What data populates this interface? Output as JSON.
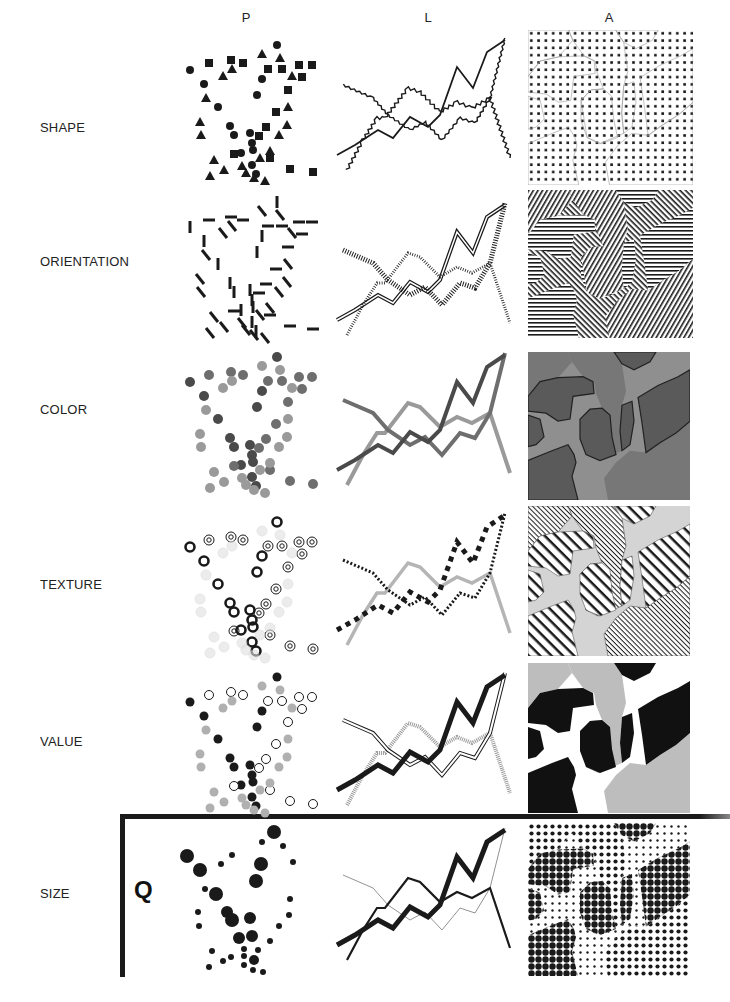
{
  "figure": {
    "columns": [
      {
        "key": "P",
        "label": "P",
        "meaning": "point"
      },
      {
        "key": "L",
        "label": "L",
        "meaning": "line"
      },
      {
        "key": "A",
        "label": "A",
        "meaning": "area"
      }
    ],
    "rows": [
      {
        "key": "shape",
        "label": "SHAPE"
      },
      {
        "key": "orientation",
        "label": "ORIENTATION"
      },
      {
        "key": "color",
        "label": "COLOR"
      },
      {
        "key": "texture",
        "label": "TEXTURE"
      },
      {
        "key": "value",
        "label": "VALUE"
      },
      {
        "key": "size",
        "label": "SIZE"
      }
    ],
    "quantitative_marker": "Q",
    "colors": {
      "ink": "#1a1a1a",
      "dark_gray": "#4a4a4a",
      "mid_gray": "#6e6e6e",
      "light_gray": "#9a9a9a",
      "pale_gray": "#c8c8c8",
      "area_dark": "#5a5a5a",
      "area_mid": "#777777",
      "area_light": "#8f8f8f"
    }
  },
  "chart_data": {
    "type": "scatter",
    "rows": [
      "SHAPE",
      "ORIENTATION",
      "COLOR",
      "TEXTURE",
      "VALUE",
      "SIZE"
    ],
    "columns": [
      "P",
      "L",
      "A"
    ],
    "points": [
      [
        97,
        17,
        0
      ],
      [
        10,
        42,
        0
      ],
      [
        24,
        56,
        0
      ],
      [
        82,
        51,
        0
      ],
      [
        77,
        67,
        0
      ],
      [
        38,
        79,
        0
      ],
      [
        50,
        98,
        0
      ],
      [
        54,
        107,
        0
      ],
      [
        70,
        105,
        0
      ],
      [
        72,
        115,
        0
      ],
      [
        73,
        122,
        0
      ],
      [
        61,
        125,
        0
      ],
      [
        72,
        137,
        0
      ],
      [
        76,
        146,
        0
      ],
      [
        29,
        35,
        1
      ],
      [
        51,
        32,
        1
      ],
      [
        63,
        35,
        1
      ],
      [
        88,
        41,
        1
      ],
      [
        102,
        41,
        1
      ],
      [
        119,
        37,
        1
      ],
      [
        132,
        37,
        1
      ],
      [
        122,
        49,
        1
      ],
      [
        108,
        62,
        1
      ],
      [
        96,
        84,
        1
      ],
      [
        86,
        99,
        1
      ],
      [
        90,
        130,
        1
      ],
      [
        54,
        126,
        1
      ],
      [
        110,
        141,
        1
      ],
      [
        133,
        144,
        1
      ],
      [
        79,
        108,
        1
      ],
      [
        82,
        26,
        2
      ],
      [
        100,
        30,
        2
      ],
      [
        52,
        41,
        2
      ],
      [
        43,
        48,
        2
      ],
      [
        112,
        48,
        2
      ],
      [
        26,
        70,
        2
      ],
      [
        108,
        79,
        2
      ],
      [
        20,
        94,
        2
      ],
      [
        21,
        107,
        2
      ],
      [
        107,
        97,
        2
      ],
      [
        99,
        107,
        2
      ],
      [
        34,
        132,
        2
      ],
      [
        90,
        123,
        2
      ],
      [
        44,
        142,
        2
      ],
      [
        30,
        148,
        2
      ],
      [
        62,
        138,
        2
      ],
      [
        66,
        145,
        2
      ],
      [
        74,
        150,
        2
      ],
      [
        85,
        153,
        2
      ],
      [
        80,
        130,
        2
      ]
    ],
    "size_points": [
      [
        94,
        12,
        7
      ],
      [
        82,
        22,
        3
      ],
      [
        103,
        26,
        3
      ],
      [
        7,
        36,
        7
      ],
      [
        52,
        35,
        3
      ],
      [
        41,
        44,
        3
      ],
      [
        81,
        44,
        7
      ],
      [
        113,
        42,
        3
      ],
      [
        20,
        50,
        7
      ],
      [
        76,
        61,
        7
      ],
      [
        25,
        69,
        3
      ],
      [
        36,
        74,
        7
      ],
      [
        110,
        79,
        3
      ],
      [
        18,
        92,
        3
      ],
      [
        47,
        92,
        6
      ],
      [
        109,
        95,
        3
      ],
      [
        52,
        100,
        7
      ],
      [
        70,
        98,
        6
      ],
      [
        19,
        106,
        3
      ],
      [
        99,
        106,
        3
      ],
      [
        59,
        118,
        6
      ],
      [
        72,
        116,
        6
      ],
      [
        90,
        121,
        3
      ],
      [
        32,
        131,
        3
      ],
      [
        64,
        129,
        3
      ],
      [
        78,
        130,
        3
      ],
      [
        51,
        137,
        3
      ],
      [
        43,
        141,
        3
      ],
      [
        64,
        136,
        3
      ],
      [
        74,
        140,
        5
      ],
      [
        29,
        147,
        3
      ],
      [
        64,
        145,
        3
      ],
      [
        73,
        150,
        3
      ],
      [
        83,
        152,
        3
      ]
    ],
    "series": [
      {
        "name": "A",
        "values": [
          [
            2,
            125
          ],
          [
            20,
            115
          ],
          [
            43,
            100
          ],
          [
            58,
            108
          ],
          [
            75,
            87
          ],
          [
            93,
            97
          ],
          [
            105,
            85
          ],
          [
            122,
            37
          ],
          [
            138,
            58
          ],
          [
            152,
            22
          ],
          [
            170,
            10
          ]
        ]
      },
      {
        "name": "B",
        "values": [
          [
            8,
            55
          ],
          [
            38,
            68
          ],
          [
            53,
            85
          ],
          [
            75,
            100
          ],
          [
            90,
            92
          ],
          [
            107,
            110
          ],
          [
            125,
            88
          ],
          [
            140,
            93
          ],
          [
            155,
            68
          ],
          [
            170,
            8
          ]
        ]
      },
      {
        "name": "C",
        "values": [
          [
            12,
            140
          ],
          [
            28,
            110
          ],
          [
            42,
            88
          ],
          [
            50,
            88
          ],
          [
            73,
            58
          ],
          [
            85,
            62
          ],
          [
            105,
            82
          ],
          [
            122,
            72
          ],
          [
            137,
            78
          ],
          [
            155,
            68
          ],
          [
            175,
            128
          ]
        ]
      }
    ],
    "xlabel": "",
    "ylabel": "",
    "grid": false
  }
}
